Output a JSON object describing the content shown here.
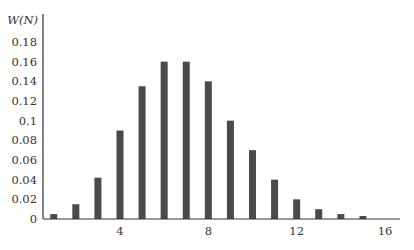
{
  "chart_data": {
    "type": "bar",
    "title": "",
    "xlabel": "",
    "ylabel": "W(N)",
    "x": [
      1,
      2,
      3,
      4,
      5,
      6,
      7,
      8,
      9,
      10,
      11,
      12,
      13,
      14,
      15
    ],
    "values": [
      0.005,
      0.015,
      0.042,
      0.09,
      0.135,
      0.16,
      0.16,
      0.14,
      0.1,
      0.07,
      0.04,
      0.02,
      0.01,
      0.005,
      0.003
    ],
    "xlim": [
      0.5,
      17
    ],
    "ylim": [
      0,
      0.2
    ],
    "x_ticks": [
      4,
      8,
      12,
      16
    ],
    "x_tick_labels": [
      "4",
      "8",
      "12",
      "16"
    ],
    "y_ticks": [
      0,
      0.02,
      0.04,
      0.06,
      0.08,
      0.1,
      0.12,
      0.14,
      0.16,
      0.18
    ],
    "y_tick_labels": [
      "0",
      "0.02",
      "0.04",
      "0.06",
      "0.08",
      "0.1",
      "0.12",
      "0.14",
      "0.16",
      "0.18"
    ],
    "grid": false,
    "legend": null,
    "bar_color": "#4a4a4a",
    "axis_color": "#333333"
  }
}
